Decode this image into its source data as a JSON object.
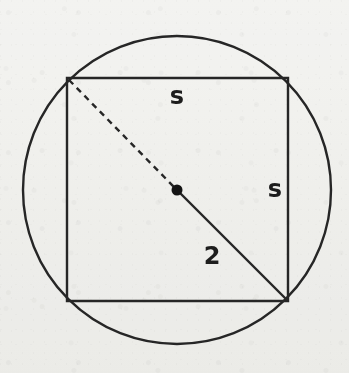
{
  "figure": {
    "title": "Square inscribed in a circle",
    "width": 349,
    "height": 373,
    "background_color": "#f6f6f4",
    "ink_color": "#262626"
  },
  "circle": {
    "name": "circumscribed-circle",
    "center_x": 177,
    "center_y": 190,
    "radius": 154,
    "stroke_width": 2.4,
    "stroke_color": "#262626",
    "fill": "none"
  },
  "square": {
    "name": "inscribed-square",
    "left": 67,
    "top": 78,
    "right": 288,
    "bottom": 301,
    "stroke_width": 2.4,
    "stroke_color": "#262626",
    "fill": "none",
    "corners": {
      "top_left": [
        67,
        78
      ],
      "top_right": [
        288,
        78
      ],
      "bottom_right": [
        288,
        301
      ],
      "bottom_left": [
        67,
        301
      ]
    }
  },
  "center_point": {
    "name": "circle-center-dot",
    "x": 177,
    "y": 190,
    "radius": 5.5,
    "fill": "#141414"
  },
  "radius_dashed": {
    "name": "dashed-radius-to-top-left",
    "x1": 69,
    "y1": 80,
    "x2": 175,
    "y2": 188,
    "stroke_width": 2.4,
    "stroke_color": "#262626",
    "dash_pattern": "6 5",
    "style": "dashed"
  },
  "radius_solid": {
    "name": "solid-radius-to-bottom-right",
    "x1": 179,
    "y1": 192,
    "x2": 287,
    "y2": 300,
    "stroke_width": 2.4,
    "stroke_color": "#262626",
    "style": "solid"
  },
  "labels": {
    "side_top": {
      "text": "s",
      "x": 177,
      "y": 97,
      "font_size": 24
    },
    "side_right": {
      "text": "s",
      "x": 275,
      "y": 190,
      "font_size": 24
    },
    "radius_value": {
      "text": "2",
      "x": 212,
      "y": 257,
      "font_size": 24
    }
  }
}
